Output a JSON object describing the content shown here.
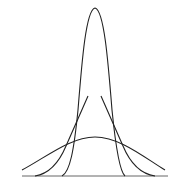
{
  "figure": {
    "stroke_color": "#222222",
    "baseline": {
      "y": 176,
      "x_start": 22,
      "x_end": 168
    },
    "curves": [
      {
        "name": "narrow",
        "label": "small variance",
        "peak": [
          95,
          8
        ],
        "feet": [
          62,
          125
        ]
      },
      {
        "name": "medium",
        "label": "medium variance",
        "truncated_tops": [
          [
            88,
            96
          ],
          [
            101,
            96
          ]
        ],
        "feet": [
          35,
          155
        ]
      },
      {
        "name": "wide",
        "label": "large variance",
        "peak": [
          95,
          137
        ],
        "ends": [
          [
            22,
            170
          ],
          [
            165,
            170
          ]
        ]
      }
    ]
  },
  "caption": {
    "text": ""
  }
}
